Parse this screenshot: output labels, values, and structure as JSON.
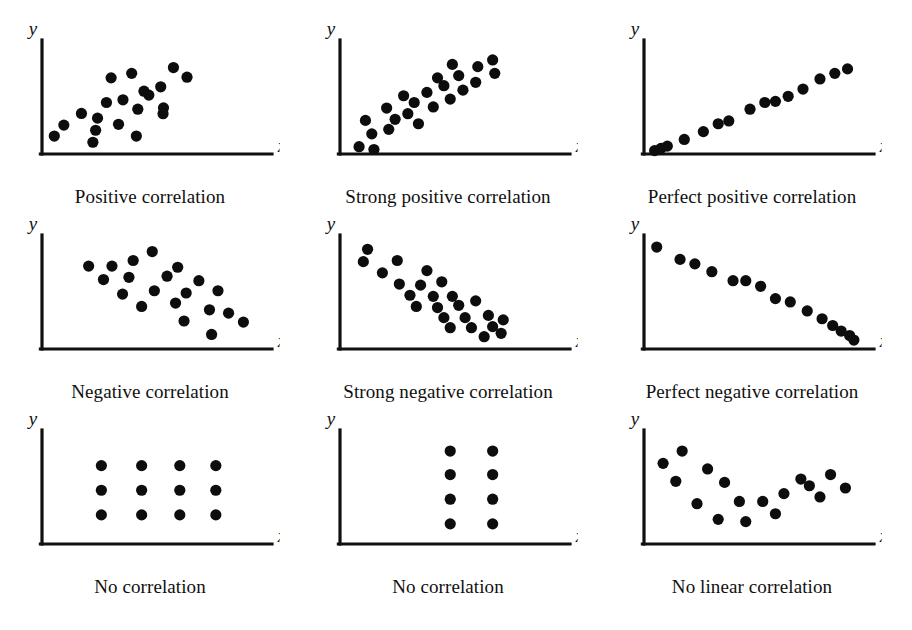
{
  "figure": {
    "title_visible": false,
    "background": "#ffffff",
    "ink_color": "#0d0d0d",
    "axis_labels": {
      "x": "x",
      "y": "y"
    },
    "rows": 3,
    "cols": 3
  },
  "panels": [
    {
      "id": "positive-correlation",
      "caption": "Positive correlation",
      "row": 0,
      "col": 0,
      "pattern": "scattered upward cloud",
      "n_points": 20
    },
    {
      "id": "strong-positive-correlation",
      "caption": "Strong positive correlation",
      "row": 0,
      "col": 1,
      "pattern": "tight upward band",
      "n_points": 23
    },
    {
      "id": "perfect-positive-correlation",
      "caption": "Perfect positive correlation",
      "row": 0,
      "col": 2,
      "pattern": "points on a straight rising line",
      "n_points": 15
    },
    {
      "id": "negative-correlation",
      "caption": "Negative correlation",
      "row": 1,
      "col": 0,
      "pattern": "scattered downward cloud",
      "n_points": 20
    },
    {
      "id": "strong-negative-correlation",
      "caption": "Strong negative correlation",
      "row": 1,
      "col": 1,
      "pattern": "tight downward band",
      "n_points": 24
    },
    {
      "id": "perfect-negative-correlation",
      "caption": "Perfect negative correlation",
      "row": 1,
      "col": 2,
      "pattern": "points on a straight falling line",
      "n_points": 15
    },
    {
      "id": "no-correlation-grid",
      "caption": "No correlation",
      "row": 2,
      "col": 0,
      "pattern": "4 by 3 rectangular grid",
      "n_points": 12
    },
    {
      "id": "no-correlation-vertical",
      "caption": "No correlation",
      "row": 2,
      "col": 1,
      "pattern": "2 by 4 vertical grid",
      "n_points": 8
    },
    {
      "id": "no-linear-correlation",
      "caption": "No linear correlation",
      "row": 2,
      "col": 2,
      "pattern": "U-shaped curved cloud",
      "n_points": 17
    }
  ],
  "chart_data": [
    {
      "type": "scatter",
      "title": "Positive correlation",
      "xlabel": "x",
      "ylabel": "y",
      "xlim": [
        0,
        100
      ],
      "ylim": [
        0,
        100
      ],
      "grid": false,
      "ticks": false,
      "points": [
        [
          38.2,
          48.4
        ],
        [
          48.1,
          56.1
        ],
        [
          26.2,
          32.0
        ],
        [
          57.3,
          41.2
        ],
        [
          32.6,
          68.0
        ],
        [
          42.3,
          72.0
        ],
        [
          62.0,
          77.2
        ],
        [
          68.4,
          68.6
        ],
        [
          18.6,
          36.2
        ],
        [
          30.4,
          46.0
        ],
        [
          50.4,
          52.6
        ],
        [
          36.1,
          26.5
        ],
        [
          10.3,
          25.8
        ],
        [
          45.2,
          40.0
        ],
        [
          57.1,
          36.0
        ],
        [
          25.3,
          21.2
        ],
        [
          5.8,
          16.0
        ],
        [
          44.5,
          16.0
        ],
        [
          24.0,
          10.5
        ],
        [
          56.0,
          60.0
        ]
      ]
    },
    {
      "type": "scatter",
      "title": "Strong positive correlation",
      "xlabel": "x",
      "ylabel": "y",
      "xlim": [
        0,
        100
      ],
      "ylim": [
        0,
        100
      ],
      "grid": false,
      "ticks": false,
      "points": [
        [
          9.0,
          6.5
        ],
        [
          16.0,
          4.0
        ],
        [
          15.0,
          18.0
        ],
        [
          23.0,
          22.0
        ],
        [
          12.0,
          30.0
        ],
        [
          26.0,
          31.0
        ],
        [
          22.0,
          41.0
        ],
        [
          32.0,
          36.0
        ],
        [
          37.0,
          27.0
        ],
        [
          35.0,
          46.0
        ],
        [
          44.0,
          42.0
        ],
        [
          41.0,
          55.0
        ],
        [
          52.0,
          49.0
        ],
        [
          30.0,
          52.0
        ],
        [
          49.0,
          61.0
        ],
        [
          58.0,
          57.0
        ],
        [
          46.0,
          68.0
        ],
        [
          56.0,
          70.0
        ],
        [
          64.0,
          64.0
        ],
        [
          53.0,
          80.0
        ],
        [
          65.0,
          78.0
        ],
        [
          73.0,
          72.0
        ],
        [
          72.0,
          84.0
        ]
      ]
    },
    {
      "type": "scatter",
      "title": "Perfect positive correlation",
      "xlabel": "x",
      "ylabel": "y",
      "xlim": [
        0,
        100
      ],
      "ylim": [
        0,
        100
      ],
      "grid": false,
      "ticks": false,
      "points": [
        [
          5.0,
          3.0
        ],
        [
          8.0,
          5.0
        ],
        [
          11.0,
          7.0
        ],
        [
          19.0,
          13.0
        ],
        [
          28.0,
          20.0
        ],
        [
          35.0,
          27.0
        ],
        [
          40.0,
          29.5
        ],
        [
          50.0,
          40.0
        ],
        [
          57.0,
          46.0
        ],
        [
          62.0,
          47.0
        ],
        [
          68.0,
          51.5
        ],
        [
          75.0,
          58.0
        ],
        [
          83.0,
          67.0
        ],
        [
          90.0,
          72.0
        ],
        [
          96.0,
          76.0
        ]
      ]
    },
    {
      "type": "scatter",
      "title": "Negative correlation",
      "xlabel": "x",
      "ylabel": "y",
      "xlim": [
        0,
        100
      ],
      "ylim": [
        0,
        100
      ],
      "grid": false,
      "ticks": false,
      "points": [
        [
          22.0,
          74.0
        ],
        [
          33.0,
          74.0
        ],
        [
          43.0,
          79.0
        ],
        [
          52.0,
          87.0
        ],
        [
          64.0,
          73.0
        ],
        [
          29.0,
          62.0
        ],
        [
          41.0,
          64.0
        ],
        [
          59.0,
          65.0
        ],
        [
          74.0,
          61.0
        ],
        [
          38.0,
          49.0
        ],
        [
          53.0,
          52.0
        ],
        [
          68.0,
          50.0
        ],
        [
          83.0,
          52.0
        ],
        [
          47.0,
          38.0
        ],
        [
          63.0,
          41.0
        ],
        [
          79.0,
          35.0
        ],
        [
          88.0,
          32.0
        ],
        [
          67.0,
          25.0
        ],
        [
          95.0,
          24.0
        ],
        [
          80.0,
          13.0
        ]
      ]
    },
    {
      "type": "scatter",
      "title": "Strong negative correlation",
      "xlabel": "x",
      "ylabel": "y",
      "xlim": [
        0,
        100
      ],
      "ylim": [
        0,
        100
      ],
      "grid": false,
      "ticks": false,
      "points": [
        [
          13.0,
          89.0
        ],
        [
          11.0,
          78.0
        ],
        [
          27.0,
          79.0
        ],
        [
          20.0,
          68.0
        ],
        [
          41.0,
          70.0
        ],
        [
          28.0,
          58.0
        ],
        [
          38.0,
          57.0
        ],
        [
          48.0,
          60.0
        ],
        [
          33.0,
          48.0
        ],
        [
          44.0,
          47.0
        ],
        [
          53.0,
          47.0
        ],
        [
          36.0,
          38.0
        ],
        [
          46.0,
          37.0
        ],
        [
          56.0,
          39.0
        ],
        [
          64.0,
          43.0
        ],
        [
          49.0,
          28.0
        ],
        [
          59.0,
          28.0
        ],
        [
          70.0,
          30.0
        ],
        [
          52.0,
          19.0
        ],
        [
          62.0,
          19.0
        ],
        [
          72.0,
          20.0
        ],
        [
          77.0,
          26.0
        ],
        [
          68.0,
          11.0
        ],
        [
          76.0,
          14.0
        ]
      ]
    },
    {
      "type": "scatter",
      "title": "Perfect negative correlation",
      "xlabel": "x",
      "ylabel": "y",
      "xlim": [
        0,
        100
      ],
      "ylim": [
        0,
        100
      ],
      "grid": false,
      "ticks": false,
      "points": [
        [
          6.0,
          91.0
        ],
        [
          17.0,
          80.0
        ],
        [
          24.0,
          76.0
        ],
        [
          32.0,
          69.0
        ],
        [
          42.0,
          61.0
        ],
        [
          48.0,
          61.0
        ],
        [
          55.0,
          56.0
        ],
        [
          62.0,
          45.0
        ],
        [
          69.0,
          42.0
        ],
        [
          77.0,
          34.0
        ],
        [
          84.0,
          27.0
        ],
        [
          89.0,
          21.0
        ],
        [
          93.0,
          16.0
        ],
        [
          97.0,
          12.0
        ],
        [
          99.0,
          8.0
        ]
      ]
    },
    {
      "type": "scatter",
      "title": "No correlation",
      "xlabel": "x",
      "ylabel": "y",
      "xlim": [
        0,
        100
      ],
      "ylim": [
        0,
        100
      ],
      "grid": false,
      "ticks": false,
      "points": [
        [
          28.0,
          70.0
        ],
        [
          47.0,
          70.0
        ],
        [
          65.0,
          70.0
        ],
        [
          82.0,
          70.0
        ],
        [
          28.0,
          48.0
        ],
        [
          47.0,
          48.0
        ],
        [
          65.0,
          48.0
        ],
        [
          82.0,
          48.0
        ],
        [
          28.0,
          26.0
        ],
        [
          47.0,
          26.0
        ],
        [
          65.0,
          26.0
        ],
        [
          82.0,
          26.0
        ]
      ]
    },
    {
      "type": "scatter",
      "title": "No correlation",
      "xlabel": "x",
      "ylabel": "y",
      "xlim": [
        0,
        100
      ],
      "ylim": [
        0,
        100
      ],
      "grid": false,
      "ticks": false,
      "points": [
        [
          52.0,
          83.0
        ],
        [
          72.0,
          83.0
        ],
        [
          52.0,
          62.0
        ],
        [
          72.0,
          62.0
        ],
        [
          52.0,
          40.0
        ],
        [
          72.0,
          40.0
        ],
        [
          52.0,
          18.0
        ],
        [
          72.0,
          18.0
        ]
      ]
    },
    {
      "type": "scatter",
      "title": "No linear correlation",
      "xlabel": "x",
      "ylabel": "y",
      "xlim": [
        0,
        100
      ],
      "ylim": [
        0,
        100
      ],
      "grid": false,
      "ticks": false,
      "points": [
        [
          9.0,
          72.0
        ],
        [
          18.0,
          83.0
        ],
        [
          30.0,
          67.0
        ],
        [
          15.0,
          56.0
        ],
        [
          38.0,
          55.0
        ],
        [
          25.0,
          36.0
        ],
        [
          45.0,
          38.0
        ],
        [
          56.0,
          38.0
        ],
        [
          35.0,
          22.0
        ],
        [
          48.0,
          20.0
        ],
        [
          66.0,
          45.0
        ],
        [
          62.0,
          27.0
        ],
        [
          78.0,
          52.0
        ],
        [
          88.0,
          62.0
        ],
        [
          74.0,
          58.0
        ],
        [
          83.0,
          42.0
        ],
        [
          95.0,
          50.0
        ]
      ]
    }
  ]
}
